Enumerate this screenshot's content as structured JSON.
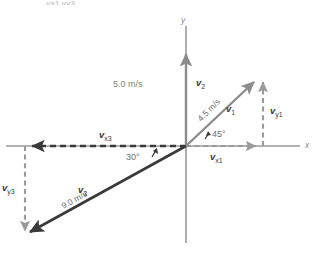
{
  "figure": {
    "type": "vector-diagram",
    "cut_off_top_label": "vx1  vy3",
    "axes": {
      "x_label": "x",
      "y_label": "y",
      "origin_px": [
        186,
        146
      ]
    },
    "colors": {
      "axis": "#9a9a9a",
      "vector_dark": "#3a3a3a",
      "vector_gray": "#8c8c8c",
      "dashed_gray": "#9a9a9a",
      "dashed_dark": "#3a3a3a",
      "text_gray": "#808080",
      "text_dark": "#3a3a3a"
    },
    "vectors": [
      {
        "name": "v1",
        "label": "v",
        "subscript": "1",
        "magnitude_label": "4.5 m/s",
        "angle_label": "45°",
        "angle_deg": 45,
        "direction": "up-right",
        "style": "solid",
        "color": "#8c8c8c"
      },
      {
        "name": "v2",
        "label": "v",
        "subscript": "2",
        "magnitude_label": "5.0 m/s",
        "angle_deg": 90,
        "direction": "up",
        "style": "solid",
        "color": "#8c8c8c"
      },
      {
        "name": "v3",
        "label": "v",
        "subscript": "3",
        "magnitude_label": "9.0 m/s",
        "angle_label": "30°",
        "angle_deg": 210,
        "direction": "down-left",
        "style": "solid",
        "color": "#3a3a3a"
      }
    ],
    "components": [
      {
        "name": "vx1",
        "label": "v",
        "subscript": "x1",
        "style": "dashed",
        "direction": "right",
        "color": "#9a9a9a"
      },
      {
        "name": "vy1",
        "label": "v",
        "subscript": "y1",
        "style": "dashed",
        "direction": "up",
        "color": "#9a9a9a"
      },
      {
        "name": "vx3",
        "label": "v",
        "subscript": "x3",
        "style": "dashed",
        "direction": "left",
        "color": "#3a3a3a"
      },
      {
        "name": "vy3",
        "label": "v",
        "subscript": "y3",
        "style": "dashed",
        "direction": "down",
        "color": "#9a9a9a"
      }
    ]
  }
}
